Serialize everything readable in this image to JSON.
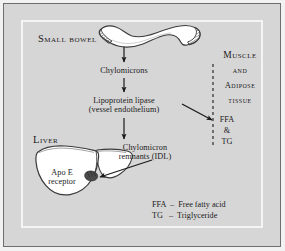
{
  "figure": {
    "background_color": "#d6d6d6",
    "frame_color": "#6e6e6e",
    "inner_frame_color": "#f4f4f4",
    "organ_fill": "#ffffff",
    "organ_stroke": "#3a3a3a",
    "arrow_color": "#1a1a1a",
    "receptor_color": "#4a4a4a"
  },
  "organs": {
    "small_bowel": {
      "label": "Small bowel",
      "shape": "small-bowel-shape"
    },
    "liver": {
      "label": "Liver",
      "shape": "liver-shape",
      "receptor_label_line1": "Apo E",
      "receptor_label_line2": "receptor"
    }
  },
  "pathway": {
    "step1": "Chylomicrons",
    "step2_line1": "Lipoprotein lipase",
    "step2_line2": "(vessel endothelium)",
    "step3_line1": "Chylomicron",
    "step3_line2": "remnants (IDL)"
  },
  "tissue_panel": {
    "line1": "Muscle",
    "line2": "and",
    "line3": "Adipose",
    "line4": "tissue",
    "uptake1": "FFA",
    "uptake2": "&",
    "uptake3": "TG"
  },
  "legend": {
    "rows": [
      "FFA  –  Free fatty acid",
      "TG   –  Triglyceride"
    ]
  }
}
